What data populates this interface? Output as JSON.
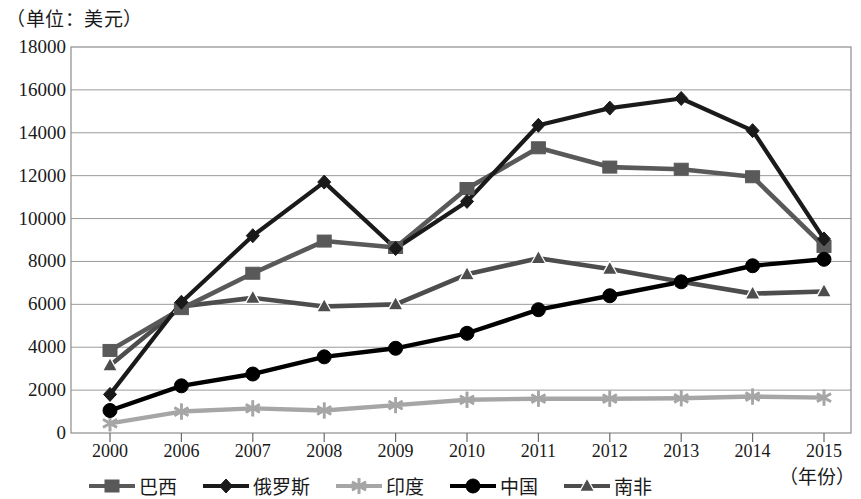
{
  "chart_data": {
    "type": "line",
    "title": "（单位：美元）",
    "xlabel": "（年份）",
    "ylabel": "",
    "unit_note": "（单位：美元）",
    "year_note": "（年份）",
    "categories": [
      "2000",
      "2006",
      "2007",
      "2008",
      "2009",
      "2010",
      "2011",
      "2012",
      "2013",
      "2014",
      "2015"
    ],
    "x": [
      2000,
      2006,
      2007,
      2008,
      2009,
      2010,
      2011,
      2012,
      2013,
      2014,
      2015
    ],
    "ylim": [
      0,
      18000
    ],
    "ytick_labels": [
      "18000",
      "16000",
      "14000",
      "12000",
      "10000",
      "8000",
      "6000",
      "4000",
      "2000",
      "0"
    ],
    "yticks": [
      18000,
      16000,
      14000,
      12000,
      10000,
      8000,
      6000,
      4000,
      2000,
      0
    ],
    "grid": true,
    "legend_position": "bottom",
    "series": [
      {
        "name": "巴西",
        "marker": "square",
        "color": "#595959",
        "values": [
          3850,
          5800,
          7450,
          8950,
          8650,
          11400,
          13300,
          12400,
          12300,
          11950,
          8700
        ]
      },
      {
        "name": "俄罗斯",
        "marker": "diamond",
        "color": "#1a1a1a",
        "values": [
          1800,
          6100,
          9200,
          11700,
          8600,
          10800,
          14350,
          15150,
          15600,
          14100,
          9050
        ]
      },
      {
        "name": "印度",
        "marker": "asterisk",
        "color": "#a6a6a6",
        "values": [
          450,
          1000,
          1150,
          1050,
          1300,
          1550,
          1600,
          1600,
          1620,
          1700,
          1650
        ]
      },
      {
        "name": "中国",
        "marker": "circle",
        "color": "#000000",
        "values": [
          1050,
          2200,
          2750,
          3550,
          3950,
          4650,
          5750,
          6400,
          7050,
          7800,
          8100
        ]
      },
      {
        "name": "南非",
        "marker": "triangle",
        "color": "#4d4d4d",
        "values": [
          3150,
          5900,
          6300,
          5900,
          6000,
          7400,
          8150,
          7650,
          7050,
          6500,
          6600
        ]
      }
    ]
  }
}
